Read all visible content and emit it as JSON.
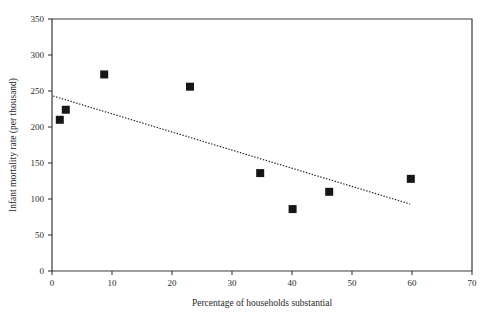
{
  "chart_data": {
    "type": "scatter",
    "title": "",
    "xlabel": "Percentage of households substantial",
    "ylabel": "Infant mortality rate (per thousand)",
    "xlim": [
      0,
      70
    ],
    "ylim": [
      0,
      350
    ],
    "xticks": [
      0,
      10,
      20,
      30,
      40,
      50,
      60,
      70
    ],
    "yticks": [
      0,
      50,
      100,
      150,
      200,
      250,
      300,
      350
    ],
    "xtick_labels": [
      "0",
      "10",
      "20",
      "30",
      "40",
      "50",
      "60",
      "70"
    ],
    "ytick_labels": [
      "0",
      "50",
      "100",
      "150",
      "200",
      "250",
      "300",
      "350"
    ],
    "grid": false,
    "legend": false,
    "marker_style": "filled-square",
    "marker_color": "#161616",
    "series": [
      {
        "name": "Districts",
        "points": [
          {
            "x": 1.3,
            "y": 210
          },
          {
            "x": 2.3,
            "y": 224
          },
          {
            "x": 8.7,
            "y": 273
          },
          {
            "x": 23.0,
            "y": 256
          },
          {
            "x": 34.7,
            "y": 136
          },
          {
            "x": 40.1,
            "y": 86
          },
          {
            "x": 46.2,
            "y": 110
          },
          {
            "x": 59.8,
            "y": 128
          }
        ]
      }
    ],
    "trendline": {
      "style": "dotted",
      "color": "#1a1a1a",
      "x_start": 0.2,
      "y_start": 243,
      "x_end": 59.7,
      "y_end": 93
    }
  },
  "figure": {
    "background_color": "#ffffff",
    "axis_color": "#3a3a3a"
  }
}
